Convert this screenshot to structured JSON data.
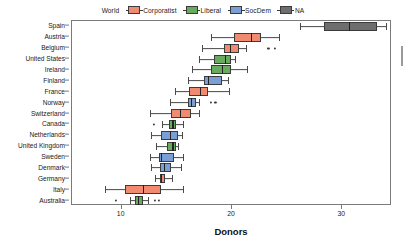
{
  "legend": {
    "items": [
      {
        "label": "World",
        "color": null,
        "swatch": false
      },
      {
        "label": "Corporatist",
        "color": "#f08a70",
        "swatch": true
      },
      {
        "label": "Liberal",
        "color": "#6aaa5e",
        "swatch": true
      },
      {
        "label": "SocDem",
        "color": "#7b9fd4",
        "swatch": true
      },
      {
        "label": "NA",
        "color": "#6e6e6e",
        "swatch": true
      }
    ]
  },
  "axis": {
    "x_title": "Donors",
    "x_ticks": [
      10,
      20,
      30
    ],
    "x_tick_labels": [
      "10",
      "20",
      "30"
    ]
  },
  "chart_data": {
    "type": "boxplot",
    "title": "",
    "xlabel": "Donors",
    "ylabel": "",
    "xlim": [
      5.5,
      34.5
    ],
    "grid": false,
    "legend_position": "top-center",
    "orientation": "horizontal",
    "group_colors": {
      "Corporatist": "#f08a70",
      "Liberal": "#6aaa5e",
      "SocDem": "#7b9fd4",
      "NA": "#6e6e6e"
    },
    "categories": [
      "Spain",
      "Austria",
      "Belgium",
      "United States",
      "Ireland",
      "Finland",
      "France",
      "Norway",
      "Switzerland",
      "Canada",
      "Netherlands",
      "United Kingdom",
      "Sweden",
      "Denmark",
      "Germany",
      "Italy",
      "Australia"
    ],
    "boxes": [
      {
        "category": "Spain",
        "group": "NA",
        "whisker_low": 26.2,
        "q1": 28.3,
        "median": 30.6,
        "q3": 33.1,
        "whisker_high": 34.0,
        "outliers": []
      },
      {
        "category": "Austria",
        "group": "Corporatist",
        "whisker_low": 18.1,
        "q1": 20.2,
        "median": 21.7,
        "q3": 22.6,
        "whisker_high": 24.3,
        "outliers": []
      },
      {
        "category": "Belgium",
        "group": "Corporatist",
        "whisker_low": 17.3,
        "q1": 19.3,
        "median": 19.8,
        "q3": 20.6,
        "whisker_high": 21.3,
        "outliers": [
          23.3,
          23.9
        ]
      },
      {
        "category": "United States",
        "group": "Liberal",
        "whisker_low": 17.0,
        "q1": 18.4,
        "median": 19.4,
        "q3": 19.9,
        "whisker_high": 20.3,
        "outliers": []
      },
      {
        "category": "Ireland",
        "group": "Liberal",
        "whisker_low": 16.4,
        "q1": 18.1,
        "median": 19.1,
        "q3": 19.9,
        "whisker_high": 21.4,
        "outliers": []
      },
      {
        "category": "Finland",
        "group": "SocDem",
        "whisker_low": 16.0,
        "q1": 17.5,
        "median": 17.8,
        "q3": 19.1,
        "whisker_high": 19.6,
        "outliers": []
      },
      {
        "category": "France",
        "group": "Corporatist",
        "whisker_low": 14.8,
        "q1": 16.1,
        "median": 17.1,
        "q3": 17.8,
        "whisker_high": 19.7,
        "outliers": []
      },
      {
        "category": "Norway",
        "group": "SocDem",
        "whisker_low": 14.4,
        "q1": 16.0,
        "median": 16.3,
        "q3": 16.7,
        "whisker_high": 17.0,
        "outliers": [
          18.1,
          18.5
        ]
      },
      {
        "category": "Switzerland",
        "group": "Corporatist",
        "whisker_low": 12.6,
        "q1": 14.5,
        "median": 15.3,
        "q3": 16.3,
        "whisker_high": 17.0,
        "outliers": []
      },
      {
        "category": "Canada",
        "group": "Liberal",
        "whisker_low": 13.7,
        "q1": 14.3,
        "median": 14.6,
        "q3": 14.9,
        "whisker_high": 15.6,
        "outliers": [
          12.9
        ]
      },
      {
        "category": "Netherlands",
        "group": "SocDem",
        "whisker_low": 12.7,
        "q1": 13.6,
        "median": 14.4,
        "q3": 15.1,
        "whisker_high": 15.5,
        "outliers": []
      },
      {
        "category": "United Kingdom",
        "group": "Liberal",
        "whisker_low": 13.1,
        "q1": 14.1,
        "median": 14.6,
        "q3": 14.9,
        "whisker_high": 15.1,
        "outliers": []
      },
      {
        "category": "Sweden",
        "group": "SocDem",
        "whisker_low": 12.6,
        "q1": 13.4,
        "median": 13.6,
        "q3": 14.7,
        "whisker_high": 15.6,
        "outliers": []
      },
      {
        "category": "Denmark",
        "group": "SocDem",
        "whisker_low": 12.7,
        "q1": 13.5,
        "median": 13.8,
        "q3": 14.5,
        "whisker_high": 15.4,
        "outliers": []
      },
      {
        "category": "Germany",
        "group": "Corporatist",
        "whisker_low": 13.0,
        "q1": 13.5,
        "median": 13.6,
        "q3": 13.9,
        "whisker_high": 14.6,
        "outliers": []
      },
      {
        "category": "Italy",
        "group": "Corporatist",
        "whisker_low": 8.5,
        "q1": 10.3,
        "median": 11.9,
        "q3": 13.6,
        "whisker_high": 15.6,
        "outliers": []
      },
      {
        "category": "Australia",
        "group": "Liberal",
        "whisker_low": 10.8,
        "q1": 11.2,
        "median": 11.5,
        "q3": 11.9,
        "whisker_high": 12.4,
        "outliers": [
          9.5,
          13.0,
          13.4
        ]
      }
    ]
  }
}
